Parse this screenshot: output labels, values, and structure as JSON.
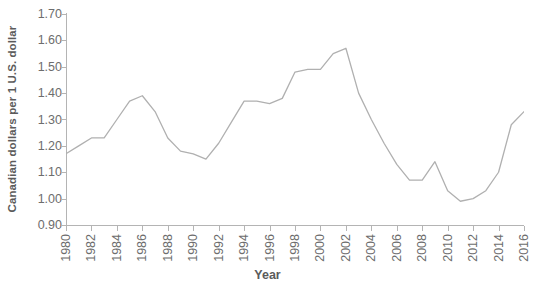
{
  "chart_data": {
    "type": "line",
    "title": "",
    "xlabel": "Year",
    "ylabel": "Canadian dollars per 1 U.S. dollar",
    "xlim": [
      1980,
      2016
    ],
    "ylim": [
      0.9,
      1.7
    ],
    "grid": false,
    "legend": null,
    "line_color": "#b0b0b0",
    "x": [
      1980,
      1981,
      1982,
      1983,
      1984,
      1985,
      1986,
      1987,
      1988,
      1989,
      1990,
      1991,
      1992,
      1993,
      1994,
      1995,
      1996,
      1997,
      1998,
      1999,
      2000,
      2001,
      2002,
      2003,
      2004,
      2005,
      2006,
      2007,
      2008,
      2009,
      2010,
      2011,
      2012,
      2013,
      2014,
      2015,
      2016
    ],
    "values": [
      1.17,
      1.2,
      1.23,
      1.23,
      1.3,
      1.37,
      1.39,
      1.33,
      1.23,
      1.18,
      1.17,
      1.15,
      1.21,
      1.29,
      1.37,
      1.37,
      1.36,
      1.38,
      1.48,
      1.49,
      1.49,
      1.55,
      1.57,
      1.4,
      1.3,
      1.21,
      1.13,
      1.07,
      1.07,
      1.14,
      1.03,
      0.99,
      1.0,
      1.03,
      1.1,
      1.28,
      1.33
    ],
    "ytick_labels": [
      "1.70",
      "1.60",
      "1.50",
      "1.40",
      "1.30",
      "1.20",
      "1.10",
      "1.00",
      "0.90"
    ],
    "ytick_values": [
      1.7,
      1.6,
      1.5,
      1.4,
      1.3,
      1.2,
      1.1,
      1.0,
      0.9
    ],
    "xtick_labels": [
      "1980",
      "1982",
      "1984",
      "1986",
      "1988",
      "1990",
      "1992",
      "1994",
      "1996",
      "1998",
      "2000",
      "2002",
      "2004",
      "2006",
      "2008",
      "2010",
      "2012",
      "2014",
      "2016"
    ],
    "xtick_values": [
      1980,
      1982,
      1984,
      1986,
      1988,
      1990,
      1992,
      1994,
      1996,
      1998,
      2000,
      2002,
      2004,
      2006,
      2008,
      2010,
      2012,
      2014,
      2016
    ]
  }
}
